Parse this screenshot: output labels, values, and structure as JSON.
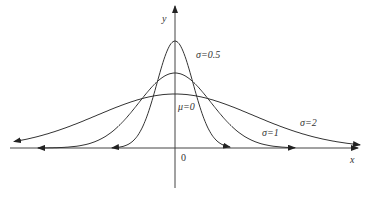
{
  "chart_data": {
    "type": "line",
    "title": "",
    "xlabel": "x",
    "ylabel": "y",
    "origin_label": "0",
    "grid": false,
    "annotation": "μ=0",
    "series": [
      {
        "name": "σ=0.5",
        "mu": 0,
        "sigma": 0.5,
        "peak": 0.798
      },
      {
        "name": "σ=1",
        "mu": 0,
        "sigma": 1,
        "peak": 0.399
      },
      {
        "name": "σ=2",
        "mu": 0,
        "sigma": 2,
        "peak": 0.199
      }
    ]
  },
  "labels": {
    "x_axis": "x",
    "y_axis": "y",
    "origin": "0",
    "mu": "μ=0",
    "s05": "σ=0.5",
    "s1": "σ=1",
    "s2": "σ=2"
  }
}
